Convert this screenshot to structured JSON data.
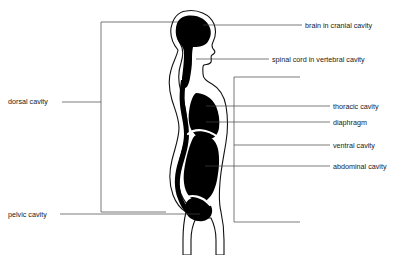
{
  "diagram": {
    "colors": {
      "cavity_fill": "#000000",
      "body_outline": "#111111",
      "leader_line": "#444444",
      "bracket_line": "#555555",
      "text": "#1a1a1a",
      "background": "#ffffff"
    },
    "labels_left": [
      {
        "id": "dorsal-cavity",
        "text": "dorsal cavity",
        "x": 8,
        "y": 104
      },
      {
        "id": "pelvic-cavity",
        "text": "pelvic cavity",
        "x": 8,
        "y": 217
      }
    ],
    "labels_right": [
      {
        "id": "brain-in-cranial-cavity",
        "text": "brain in cranial cavity",
        "x": 305,
        "y": 27
      },
      {
        "id": "spinal-cord-in-vertebral-cavity",
        "text": "spinal cord in vertebral cavity",
        "x": 272,
        "y": 61
      },
      {
        "id": "thoracic-cavity",
        "text": "thoracic cavity",
        "x": 333,
        "y": 108
      },
      {
        "id": "diaphragm",
        "text": "diaphragm",
        "x": 333,
        "y": 124
      },
      {
        "id": "ventral-cavity",
        "text": "ventral cavity",
        "x": 333,
        "y": 147
      },
      {
        "id": "abdominal-cavity",
        "text": "abdominal cavity",
        "x": 333,
        "y": 168
      }
    ]
  }
}
